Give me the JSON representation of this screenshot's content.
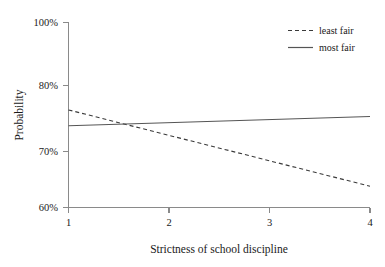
{
  "chart_data": {
    "type": "line",
    "title": "",
    "xlabel": "Strictness of school discipline",
    "ylabel": "Probability",
    "xlim": [
      1,
      4
    ],
    "ylim": [
      60,
      100
    ],
    "grid": false,
    "legend_position": "top-right",
    "x_ticks": [
      "1",
      "2",
      "3",
      "4"
    ],
    "x_tick_values": [
      1,
      2,
      3,
      4
    ],
    "y_ticks": [
      "60%",
      "70%",
      "80%",
      "100%"
    ],
    "y_tick_values": [
      60,
      70,
      80,
      100
    ],
    "y_axis_note": "irregular tick spacing; 90% tick omitted",
    "x": [
      1,
      4
    ],
    "series": [
      {
        "name": "least fair",
        "style": "dashed",
        "color": "#3a3a3a",
        "values": [
          76.3,
          63.8
        ]
      },
      {
        "name": "most fair",
        "style": "solid",
        "color": "#555555",
        "values": [
          73.9,
          75.3
        ]
      }
    ],
    "intersection_x": 1.65,
    "intersection_y": 74.3
  },
  "legend": {
    "entries": [
      {
        "label": "least fair"
      },
      {
        "label": "most fair"
      }
    ]
  },
  "axes": {
    "y_title": "Probability",
    "x_title": "Strictness of school discipline",
    "y_tick_labels": [
      "100%",
      "80%",
      "70%",
      "60%"
    ],
    "x_tick_labels": [
      "1",
      "2",
      "3",
      "4"
    ]
  }
}
